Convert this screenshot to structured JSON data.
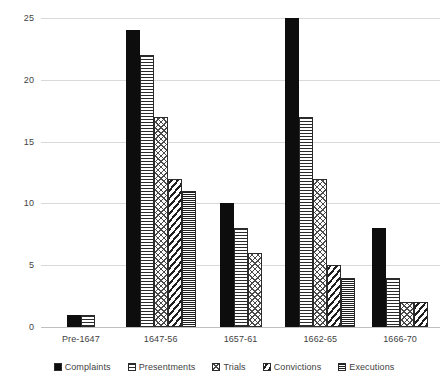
{
  "chart_data": {
    "type": "bar",
    "title": "",
    "xlabel": "",
    "ylabel": "",
    "categories": [
      "Pre-1647",
      "1647-56",
      "1657-61",
      "1662-65",
      "1666-70"
    ],
    "series": [
      {
        "name": "Complaints",
        "values": [
          1,
          24,
          10,
          25,
          8
        ]
      },
      {
        "name": "Presentments",
        "values": [
          1,
          22,
          8,
          17,
          4
        ]
      },
      {
        "name": "Trials",
        "values": [
          0,
          17,
          6,
          12,
          2
        ]
      },
      {
        "name": "Convictions",
        "values": [
          0,
          12,
          0,
          5,
          2
        ]
      },
      {
        "name": "Executions",
        "values": [
          0,
          11,
          0,
          4,
          0
        ]
      }
    ],
    "ylim": [
      0,
      25
    ],
    "yticks": [
      0,
      5,
      10,
      15,
      20,
      25
    ],
    "ytick_labels": [
      "0",
      "5",
      "10",
      "15",
      "20",
      "25"
    ],
    "grid": true,
    "legend_position": "bottom",
    "colors": {
      "complaints": "#0d0d0d",
      "presentments": "#2b2b2b",
      "trials": "#4a4a4a",
      "convictions": "#1f1f1f",
      "executions": "#1f1f1f",
      "gridline": "#d9d9d9",
      "axis_text": "#3f3f3f",
      "background": "#ffffff"
    },
    "patterns": {
      "complaints": "solid-black",
      "presentments": "horizontal-lines",
      "trials": "crosshatch-diamond",
      "convictions": "diagonal-stripes",
      "executions": "dense-horizontal-lines"
    }
  }
}
